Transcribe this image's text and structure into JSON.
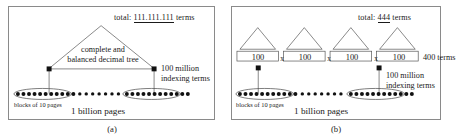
{
  "figure": {
    "background": "#ffffff",
    "line_color": "#4a4a4a",
    "text_color": "#1a1a1a"
  },
  "panel_a": {
    "caption": "(a)",
    "total_prefix": "total: ",
    "total_number": "111.111.111",
    "total_suffix": " terms",
    "tree_label_line1": "complete  and",
    "tree_label_line2": "balanced decimal tree",
    "indexing_line1": "100 million",
    "indexing_line2": "indexing terms",
    "blocks_label": "blocks of 10 pages",
    "pages_label": "1 billion pages",
    "dot_count": 30,
    "ellipse_count": 2
  },
  "panel_b": {
    "caption": "(b)",
    "total_prefix": "total: ",
    "total_number": "444",
    "total_suffix": " terms",
    "boxes": [
      "100",
      "100",
      "100",
      "100"
    ],
    "separators": [
      "x",
      "x",
      "x"
    ],
    "terms_label": "400 terms",
    "indexing_line1": "100 million",
    "indexing_line2": "indexing terms",
    "blocks_label": "blocks of 10 pages",
    "pages_label": "1 billion pages",
    "triangle_count": 4,
    "dot_count": 30,
    "ellipse_count": 2
  }
}
